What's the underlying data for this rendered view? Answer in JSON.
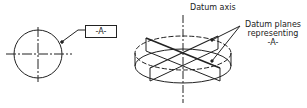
{
  "left_view": {
    "datum_tag": "-A-"
  },
  "right_view": {
    "axis_label": "Datum axis",
    "planes_label_lines": [
      "Datum planes",
      "representing",
      "-A-"
    ]
  },
  "colors": {
    "ink": "#222222",
    "background": "#ffffff"
  }
}
